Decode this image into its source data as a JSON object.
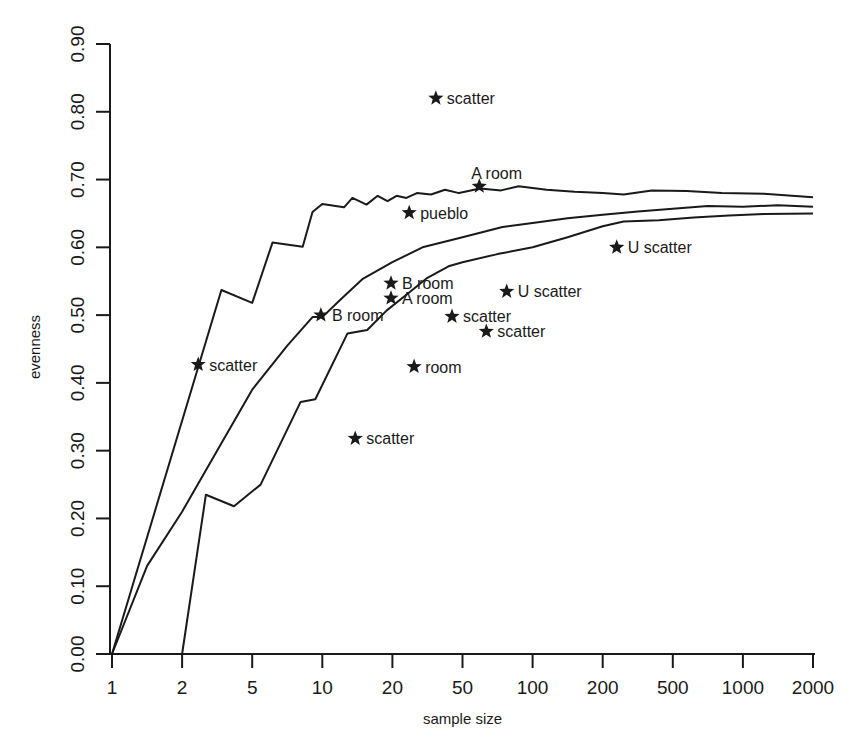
{
  "chart_data": {
    "type": "line",
    "title": "",
    "xlabel": "sample size",
    "ylabel": "evenness",
    "x_scale": "ordinal (equally spaced ticks)",
    "x_ticks": [
      "1",
      "2",
      "5",
      "10",
      "20",
      "50",
      "100",
      "200",
      "500",
      "1000",
      "2000"
    ],
    "y_ticks": [
      "0.00",
      "0.10",
      "0.20",
      "0.30",
      "0.40",
      "0.50",
      "0.60",
      "0.70",
      "0.80",
      "0.90"
    ],
    "ylim": [
      0,
      0.9
    ],
    "grid": false,
    "legend": null,
    "series": [
      {
        "name": "upper bound",
        "x_index": [
          0,
          1.56,
          2.0,
          2.29,
          2.72,
          2.86,
          3.0,
          3.31,
          3.43,
          3.63,
          3.79,
          3.93,
          4.06,
          4.2,
          4.35,
          4.55,
          4.75,
          4.95,
          5.25,
          5.55,
          5.8,
          6.2,
          6.6,
          7.0,
          7.3,
          7.7,
          8.2,
          8.7,
          9.3,
          10.0
        ],
        "values": [
          0.0,
          0.537,
          0.518,
          0.607,
          0.601,
          0.652,
          0.664,
          0.659,
          0.673,
          0.663,
          0.676,
          0.668,
          0.676,
          0.673,
          0.68,
          0.678,
          0.685,
          0.68,
          0.687,
          0.684,
          0.69,
          0.685,
          0.682,
          0.68,
          0.678,
          0.684,
          0.683,
          0.68,
          0.679,
          0.674
        ]
      },
      {
        "name": "expected",
        "x_index": [
          0,
          0.5,
          1.0,
          1.5,
          2.0,
          2.5,
          2.86,
          3.0,
          3.25,
          3.57,
          4.0,
          4.43,
          5.0,
          5.57,
          6.0,
          6.5,
          7.0,
          7.5,
          8.0,
          8.5,
          9.0,
          9.5,
          10.0
        ],
        "values": [
          0.0,
          0.13,
          0.21,
          0.3,
          0.39,
          0.455,
          0.497,
          0.497,
          0.522,
          0.553,
          0.578,
          0.6,
          0.615,
          0.63,
          0.636,
          0.643,
          0.648,
          0.653,
          0.657,
          0.661,
          0.66,
          0.662,
          0.66
        ]
      },
      {
        "name": "lower bound",
        "x_index": [
          1.0,
          1.34,
          1.74,
          2.12,
          2.69,
          2.9,
          3.36,
          3.64,
          3.92,
          4.2,
          4.5,
          4.8,
          5.0,
          5.5,
          6.0,
          6.5,
          7.0,
          7.3,
          7.8,
          8.3,
          8.8,
          9.3,
          10.0
        ],
        "values": [
          0.0,
          0.235,
          0.218,
          0.25,
          0.372,
          0.376,
          0.473,
          0.478,
          0.507,
          0.53,
          0.555,
          0.572,
          0.578,
          0.59,
          0.6,
          0.615,
          0.631,
          0.638,
          0.64,
          0.644,
          0.647,
          0.649,
          0.65
        ]
      }
    ],
    "points": [
      {
        "label": "scatter",
        "x": 35,
        "x_index": 4.62,
        "y": 0.82
      },
      {
        "label": "A room",
        "x": 60,
        "x_index": 5.24,
        "y": 0.69,
        "label_pos": "above"
      },
      {
        "label": "pueblo",
        "x": 24,
        "x_index": 4.24,
        "y": 0.651
      },
      {
        "label": "U scatter",
        "x": 230,
        "x_index": 7.2,
        "y": 0.6
      },
      {
        "label": "B room",
        "x": 20,
        "x_index": 3.98,
        "y": 0.547
      },
      {
        "label": "A room",
        "x": 20,
        "x_index": 3.98,
        "y": 0.525
      },
      {
        "label": "U scatter",
        "x": 75,
        "x_index": 5.63,
        "y": 0.535
      },
      {
        "label": "B room",
        "x": 10,
        "x_index": 2.98,
        "y": 0.5
      },
      {
        "label": "scatter",
        "x": 44,
        "x_index": 4.85,
        "y": 0.498
      },
      {
        "label": "scatter",
        "x": 64,
        "x_index": 5.34,
        "y": 0.476
      },
      {
        "label": "scatter",
        "x": 2.4,
        "x_index": 1.23,
        "y": 0.427
      },
      {
        "label": "room",
        "x": 25,
        "x_index": 4.31,
        "y": 0.424
      },
      {
        "label": "scatter",
        "x": 14,
        "x_index": 3.47,
        "y": 0.318
      }
    ]
  }
}
